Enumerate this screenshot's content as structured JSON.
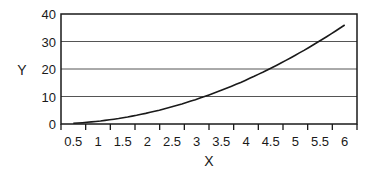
{
  "chart_data": {
    "type": "line",
    "title": "",
    "xlabel": "X",
    "ylabel": "Y",
    "x_tick_labels": [
      "0.5",
      "1",
      "1.5",
      "2",
      "2.5",
      "3",
      "3.5",
      "4",
      "4.5",
      "5",
      "5.5",
      "6"
    ],
    "y_tick_labels": [
      "0",
      "10",
      "20",
      "30",
      "40"
    ],
    "ylim": [
      0,
      40
    ],
    "xlim": [
      0.5,
      6
    ],
    "grid": {
      "horizontal": true,
      "vertical": false
    },
    "legend": null,
    "series": [
      {
        "name": "Y",
        "x": [
          0.5,
          1,
          1.5,
          2,
          2.5,
          3,
          3.5,
          4,
          4.5,
          5,
          5.5,
          6
        ],
        "values": [
          0.25,
          1,
          2.25,
          4,
          6.25,
          9,
          12.25,
          16,
          20.25,
          25,
          30.25,
          36
        ]
      }
    ],
    "colors": {
      "line": "#1a1a1a",
      "grid": "#555555",
      "axis": "#1a1a1a"
    }
  }
}
